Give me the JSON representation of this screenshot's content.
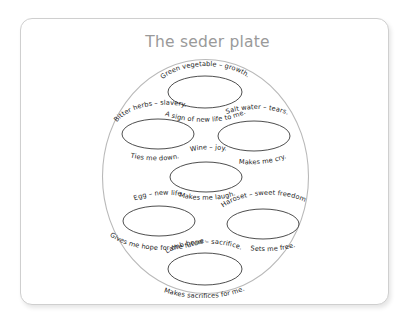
{
  "page": {
    "title": "The seder plate",
    "title_color": "#9a9a9a",
    "background_color": "#ffffff",
    "frame_border_color": "#cfcfcf"
  },
  "diagram": {
    "type": "seder-plate",
    "plate_stroke_color": "#b9b9b9",
    "oval_stroke_color": "#3a3a3a",
    "items": [
      {
        "id": "green-vegetable",
        "position": "top",
        "label": "Green vegetable – growth.",
        "caption": "A sign of new life to me."
      },
      {
        "id": "bitter-herbs",
        "position": "upper-left",
        "label": "Bitter herbs – slavery.",
        "caption": "Ties me down."
      },
      {
        "id": "salt-water",
        "position": "upper-right",
        "label": "Salt water – tears.",
        "caption": "Makes me cry."
      },
      {
        "id": "wine",
        "position": "center",
        "label": "Wine – joy.",
        "caption": "Makes me laugh."
      },
      {
        "id": "egg",
        "position": "lower-left",
        "label": "Egg – new life.",
        "caption": "Gives me hope for the future."
      },
      {
        "id": "haroset",
        "position": "lower-right",
        "label": "Haroset – sweet freedom",
        "caption": "Sets me free."
      },
      {
        "id": "lamb-bone",
        "position": "bottom",
        "label": "Lamb bone – sacrifice.",
        "caption": "Makes sacrifices for me."
      }
    ]
  }
}
